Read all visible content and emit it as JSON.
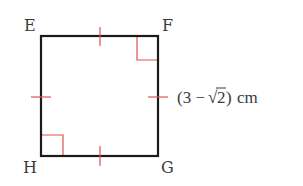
{
  "figure": {
    "shape": "square",
    "vertices": {
      "top_left": "E",
      "top_right": "F",
      "bottom_right": "G",
      "bottom_left": "H"
    },
    "side_label": {
      "open": "(3 −",
      "radical_sign": "√",
      "radicand": "2",
      "close": ")",
      "unit": "cm"
    },
    "markers": {
      "equal_side_ticks": 4,
      "right_angles": [
        "F",
        "H"
      ]
    },
    "colors": {
      "outline": "#1a1a1a",
      "marker": "#e0524f",
      "text": "#3a3a3a"
    }
  }
}
